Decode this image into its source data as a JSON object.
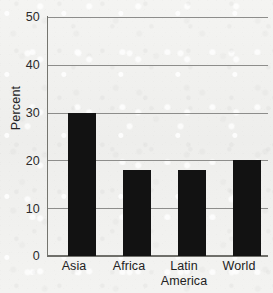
{
  "chart_data": {
    "type": "bar",
    "title": "",
    "subtitle": "",
    "xlabel": "",
    "ylabel": "Percent",
    "categories": [
      "Asia",
      "Africa",
      "Latin America",
      "World"
    ],
    "values": [
      30,
      18,
      18,
      20
    ],
    "series": [
      {
        "name": "Percent",
        "values": [
          30,
          18,
          18,
          20
        ]
      }
    ],
    "ylim": [
      0,
      50
    ],
    "yticks": [
      0,
      10,
      20,
      30,
      40,
      50
    ],
    "ytick_labels": [
      "0",
      "10",
      "20",
      "30",
      "40",
      "50"
    ],
    "xtick_labels": [
      {
        "line1": "Asia",
        "line2": ""
      },
      {
        "line1": "Africa",
        "line2": ""
      },
      {
        "line1": "Latin",
        "line2": "America"
      },
      {
        "line1": "World",
        "line2": ""
      }
    ],
    "grid": true,
    "grid_axis": "y",
    "legend": false,
    "legend_position": "none",
    "annotations": [],
    "bar_color": "#121212",
    "grid_color": "#8d8d8b",
    "axis_color": "#6f6f6a",
    "background_color": "#f1f1ef",
    "text_color": "#222222"
  }
}
